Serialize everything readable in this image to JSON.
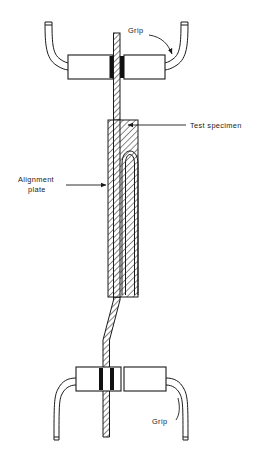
{
  "figure": {
    "name": "tensile-test-fixture-diagram",
    "width": 263,
    "height": 457,
    "background_color": "#ffffff",
    "line_color": "#1a1a1a",
    "fill_color": "#ffffff",
    "hatch_color": "#1a1a1a",
    "clamp_color": "#111111"
  },
  "labels": {
    "grip_top": "Grip",
    "grip_bottom": "Grip",
    "test_specimen": "Test specimen",
    "alignment_plate_line1": "Alignment",
    "alignment_plate_line2": "plate"
  },
  "parts": [
    {
      "id": "grip-top",
      "label": "Grip",
      "type": "clamp-assembly",
      "position": "top"
    },
    {
      "id": "grip-bottom",
      "label": "Grip",
      "type": "clamp-assembly",
      "position": "bottom"
    },
    {
      "id": "test-specimen",
      "label": "Test specimen",
      "type": "hatched-strip"
    },
    {
      "id": "alignment-plate",
      "label": "Alignment plate",
      "type": "hatched-plate"
    }
  ]
}
